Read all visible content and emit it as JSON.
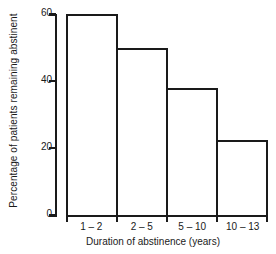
{
  "chart_data": {
    "type": "bar",
    "title": "",
    "subtitle": "",
    "categories": [
      "1 – 2",
      "2 – 5",
      "5 – 10",
      "10 – 13"
    ],
    "values": [
      60,
      50,
      38,
      22.5
    ],
    "xlabel": "Duration of abstinence (years)",
    "ylabel": "Percentage of patients remaining abstinent",
    "ylim": [
      0,
      60
    ],
    "yticks": [
      0,
      20,
      40,
      60
    ],
    "ytick_labels": [
      "0",
      "20",
      "40",
      "60"
    ],
    "grid": false,
    "legend": false,
    "legend_position": "none",
    "bar_style": "adjacent-outline",
    "colors": {
      "axis": "#1a1a1a",
      "bar_fill": "#ffffff",
      "bar_edge": "#1a1a1a",
      "background": "#ffffff",
      "text": "#1a1a1a"
    },
    "annotations": []
  }
}
